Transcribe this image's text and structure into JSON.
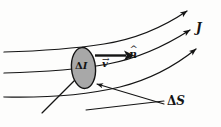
{
  "figure": {
    "background_color": "#fdfdfc",
    "ink_color": "#141414",
    "surface_fill_color": "#a8a8a8",
    "labels": {
      "current_density": "J",
      "normal_hat": "^",
      "normal_base": "n",
      "velocity_hat": "→",
      "velocity_base": "v",
      "delta_I_symbol": "Δ",
      "delta_I_quantity": "I",
      "delta_S_symbol": "Δ",
      "delta_S_quantity": "S"
    },
    "elements": {
      "streamline_count": 3,
      "surface_shape": "ellipse",
      "normal_arrow": "horizontal-right",
      "leader_lines": 2
    }
  }
}
